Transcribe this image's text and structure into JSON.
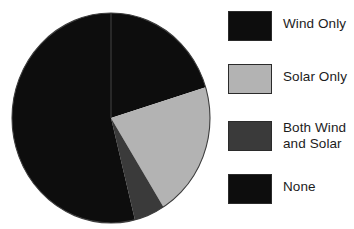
{
  "chart_data": {
    "type": "pie",
    "title": "",
    "subtitle": "",
    "xlabel": "",
    "ylabel": "",
    "grid": false,
    "legend_position": "right",
    "start_angle_deg": 0,
    "direction": "clockwise",
    "categories": [
      "Wind Only",
      "Solar Only",
      "Both Wind and Solar",
      "None"
    ],
    "values": [
      20.3,
      20.8,
      5.0,
      53.9
    ],
    "units": "percent",
    "slices": [
      {
        "label": "Wind Only",
        "value": 20.3,
        "color": "#0d0d0d",
        "start_angle_deg": 0,
        "end_angle_deg": 73
      },
      {
        "label": "Solar Only",
        "value": 20.8,
        "color": "#b3b3b3",
        "start_angle_deg": 73,
        "end_angle_deg": 148
      },
      {
        "label": "Both Wind and Solar",
        "value": 5.0,
        "color": "#3a3a3a",
        "start_angle_deg": 148,
        "end_angle_deg": 166
      },
      {
        "label": "None",
        "value": 53.9,
        "color": "#0d0d0d",
        "start_angle_deg": 166,
        "end_angle_deg": 360
      }
    ]
  },
  "legend": {
    "items": [
      {
        "label": "Wind Only",
        "color": "#0d0d0d",
        "swatch_name": "legend-swatch-wind-only"
      },
      {
        "label": "Solar Only",
        "color": "#b3b3b3",
        "swatch_name": "legend-swatch-solar-only"
      },
      {
        "label": "Both Wind\nand Solar",
        "color": "#3a3a3a",
        "swatch_name": "legend-swatch-both-wind-and-solar"
      },
      {
        "label": "None",
        "color": "#0d0d0d",
        "swatch_name": "legend-swatch-none"
      }
    ]
  },
  "colors": {
    "background": "#ffffff",
    "outline": "#2b2b2b",
    "text": "#1c1c1c",
    "black_slice": "#0d0d0d",
    "light_gray_slice": "#b3b3b3",
    "dark_gray_slice": "#3a3a3a"
  }
}
